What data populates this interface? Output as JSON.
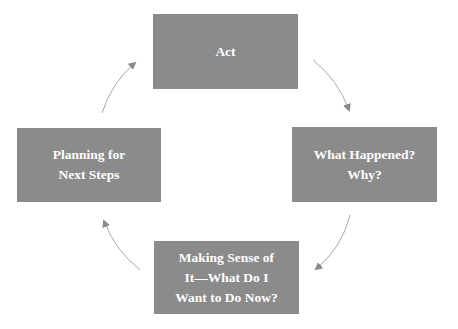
{
  "diagram": {
    "type": "cycle",
    "colors": {
      "box_fill": "#8b8b8b",
      "box_text": "#ffffff",
      "arrow": "#9a9a9a",
      "background": "#ffffff"
    },
    "steps": [
      {
        "id": "act",
        "label": "Act"
      },
      {
        "id": "what-happened",
        "label": "What Happened?\nWhy?"
      },
      {
        "id": "making-sense",
        "label": "Making Sense of\nIt—What Do I\nWant to Do Now?"
      },
      {
        "id": "planning",
        "label": "Planning for\nNext Steps"
      }
    ],
    "arrows": [
      {
        "from": "act",
        "to": "what-happened"
      },
      {
        "from": "what-happened",
        "to": "making-sense"
      },
      {
        "from": "making-sense",
        "to": "planning"
      },
      {
        "from": "planning",
        "to": "act"
      }
    ]
  }
}
